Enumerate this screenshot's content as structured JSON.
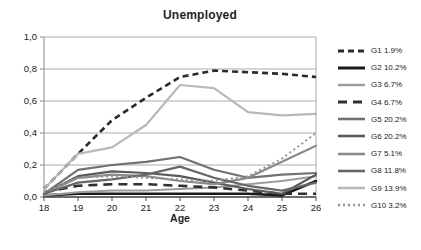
{
  "title": "Unemployed",
  "chart_data": {
    "type": "line",
    "title": "Unemployed",
    "xlabel": "Age",
    "ylabel": "",
    "x": [
      18,
      19,
      20,
      21,
      22,
      23,
      24,
      25,
      26
    ],
    "ylim": [
      0,
      1.0
    ],
    "grid": true,
    "legend_position": "right",
    "axis_color": "#8a8a8a",
    "grid_color": "#ababab",
    "bottom_axis_color": "#4a4a4a",
    "y_ticks": [
      {
        "value": 0.0,
        "label": "0,0"
      },
      {
        "value": 0.2,
        "label": "0,2"
      },
      {
        "value": 0.4,
        "label": "0,4"
      },
      {
        "value": 0.6,
        "label": "0,6"
      },
      {
        "value": 0.8,
        "label": "0,8"
      },
      {
        "value": 1.0,
        "label": "1,0"
      }
    ],
    "series": [
      {
        "name": "G1",
        "label": "G1 1.9%",
        "color": "#2b2b2b",
        "dash": "6,4",
        "width": 2.6,
        "values": [
          0.05,
          0.27,
          0.48,
          0.62,
          0.75,
          0.79,
          0.78,
          0.77,
          0.75
        ]
      },
      {
        "name": "G2",
        "label": "G2 10.2%",
        "color": "#1a1a1a",
        "dash": "",
        "width": 2.6,
        "values": [
          0.01,
          0.02,
          0.02,
          0.02,
          0.02,
          0.02,
          0.02,
          0.01,
          0.1
        ]
      },
      {
        "name": "G3",
        "label": "G3 6.7%",
        "color": "#9c9c9c",
        "dash": "",
        "width": 2.0,
        "values": [
          0.01,
          0.03,
          0.04,
          0.04,
          0.05,
          0.06,
          0.08,
          0.1,
          0.13
        ]
      },
      {
        "name": "G4",
        "label": "G4 6.7%",
        "color": "#303030",
        "dash": "9,6",
        "width": 2.6,
        "values": [
          0.03,
          0.07,
          0.08,
          0.08,
          0.07,
          0.06,
          0.04,
          0.02,
          0.02
        ]
      },
      {
        "name": "G5",
        "label": "G5 20.2%",
        "color": "#717171",
        "dash": "",
        "width": 2.2,
        "values": [
          0.02,
          0.17,
          0.2,
          0.22,
          0.25,
          0.17,
          0.12,
          0.14,
          0.15
        ]
      },
      {
        "name": "G6",
        "label": "G6 20.2%",
        "color": "#5a5a5a",
        "dash": "",
        "width": 2.2,
        "values": [
          0.02,
          0.13,
          0.16,
          0.15,
          0.13,
          0.09,
          0.05,
          0.02,
          0.14
        ]
      },
      {
        "name": "G7",
        "label": "G7 5.1%",
        "color": "#8b8b8b",
        "dash": "",
        "width": 2.2,
        "values": [
          0.02,
          0.12,
          0.14,
          0.13,
          0.1,
          0.08,
          0.12,
          0.22,
          0.32
        ]
      },
      {
        "name": "G8",
        "label": "G8 11.8%",
        "color": "#676767",
        "dash": "",
        "width": 2.2,
        "values": [
          0.02,
          0.09,
          0.11,
          0.14,
          0.19,
          0.12,
          0.07,
          0.04,
          0.09
        ]
      },
      {
        "name": "G9",
        "label": "G9 13.9%",
        "color": "#b9b9b9",
        "dash": "",
        "width": 2.2,
        "values": [
          0.05,
          0.27,
          0.31,
          0.45,
          0.7,
          0.68,
          0.53,
          0.51,
          0.52
        ]
      },
      {
        "name": "G10",
        "label": "G10 3.2%",
        "color": "#949494",
        "dash": "2,3",
        "width": 2.0,
        "values": [
          0.03,
          0.12,
          0.13,
          0.12,
          0.11,
          0.1,
          0.13,
          0.24,
          0.4
        ]
      }
    ]
  }
}
